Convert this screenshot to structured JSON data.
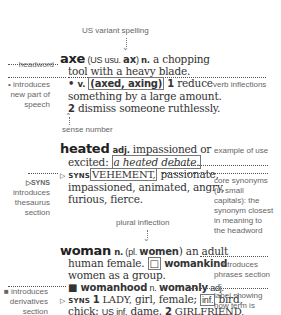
{
  "annotations": {
    "us_variant": "US variant spelling",
    "headword": "headword",
    "new_pos": [
      "• introduces",
      "new part of",
      "speech"
    ],
    "verb_inflections": "verb inflections",
    "sense_number": "sense number",
    "example_of_use": "example of use",
    "syns_intro": [
      "▷SYNS",
      "introduces",
      "thesaurus",
      "section"
    ],
    "core_synonyms": [
      "core synonyms",
      "(in small",
      "capitals): the",
      "synonym closest",
      "in meaning to",
      "the headword"
    ],
    "plural_inflection": "plural inflection",
    "phrases_intro": [
      "□ introduces",
      "phrases section"
    ],
    "derivatives_intro": [
      "■ introduces",
      "derivatives",
      "section"
    ],
    "label_showing": [
      "label showing",
      "how term is",
      "used"
    ]
  },
  "entries": {
    "axe": {
      "headword": "axe",
      "variant_open": " (US usu. ",
      "variant": "ax",
      "variant_close": ") ",
      "pos": "n.",
      "def1": " a chopping",
      "def1b": "tool with a heavy blade.",
      "bullet": "• ",
      "pos2": "v.",
      "inflections": "(axed, axing)",
      "sense1_num": "1",
      "sense1": " reduce",
      "sense1b": "something by a large amount.",
      "sense2_num": "2",
      "sense2": " dismiss someone ruthlessly."
    },
    "heated": {
      "headword": "heated",
      "pos": "adj.",
      "def": " impassioned or",
      "defb": "excited: ",
      "example": "a heated debate.",
      "syns_marker": "▷ SYNS",
      "core_syn": "VEHEMENT,",
      "syns1": " passionate,",
      "syns2": "impassioned, animated, angry,",
      "syns3": "furious, fierce."
    },
    "woman": {
      "headword": "woman",
      "pos": "n.",
      "plural_open": " (pl. ",
      "plural": "women",
      "plural_close": ") an adult",
      "def2": "human female. ",
      "phrase_marker": "□",
      "phrase": " womankind",
      "phrase_def": "women as a group.",
      "deriv_marker": "■",
      "deriv1": " womanhood",
      "deriv1_pos": " n. ",
      "deriv2": "womanly",
      "deriv2_pos": " adj.",
      "syns_marker": "▷ SYNS ",
      "s1_num": "1",
      "s1_core": " LADY,",
      "s1_rest": " girl, female; ",
      "label_inf": "inf.",
      "s1_rest2": " bird,",
      "s1_line2a": "chick; ",
      "s1_us": "US inf.",
      "s1_line2b": " dame. ",
      "s2_num": "2",
      "s2_core": " GIRLFRIEND,",
      "s2_line3": "sweetheart, partner, lover; wife."
    }
  },
  "colors": {
    "text": "#333333",
    "annotation": "#666666",
    "leader": "#555555"
  }
}
